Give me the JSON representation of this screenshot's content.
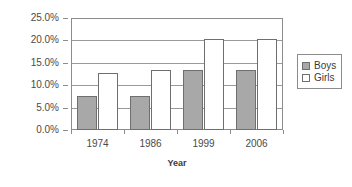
{
  "chart_data": {
    "type": "bar",
    "title": "",
    "xlabel": "Year",
    "ylabel": "",
    "categories": [
      "1974",
      "1986",
      "1999",
      "2006"
    ],
    "series": [
      {
        "name": "Boys",
        "color": "#a8a8a8",
        "values": [
          7.7,
          7.7,
          13.3,
          13.3
        ]
      },
      {
        "name": "Girls",
        "color": "#ffffff",
        "values": [
          12.8,
          13.5,
          20.4,
          20.4
        ]
      }
    ],
    "ylim": [
      0,
      25
    ],
    "ytick_values": [
      0,
      5,
      10,
      15,
      20,
      25
    ],
    "ytick_labels": [
      "0.0%",
      "5.0%",
      "10.0%",
      "15.0%",
      "20.0%",
      "25.0%"
    ],
    "grid": true,
    "legend_position": "right",
    "legend_entries": [
      "Boys",
      "Girls"
    ]
  },
  "axis": {
    "x_title": "Year"
  },
  "legend": {
    "items": [
      {
        "label": "Boys"
      },
      {
        "label": "Girls"
      }
    ]
  }
}
